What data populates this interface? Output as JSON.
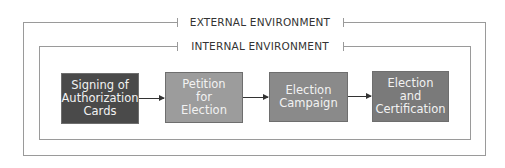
{
  "diagram": {
    "external_label": "EXTERNAL ENVIRONMENT",
    "internal_label": "INTERNAL ENVIRONMENT",
    "steps": [
      {
        "label": "Signing of\nAuthorization\nCards",
        "color": "#4a4a4a"
      },
      {
        "label": "Petition\nfor\nElection",
        "color": "#9c9c9c"
      },
      {
        "label": "Election\nCampaign",
        "color": "#8a8a8a"
      },
      {
        "label": "Election\nand\nCertification",
        "color": "#7a7a7a"
      }
    ]
  }
}
